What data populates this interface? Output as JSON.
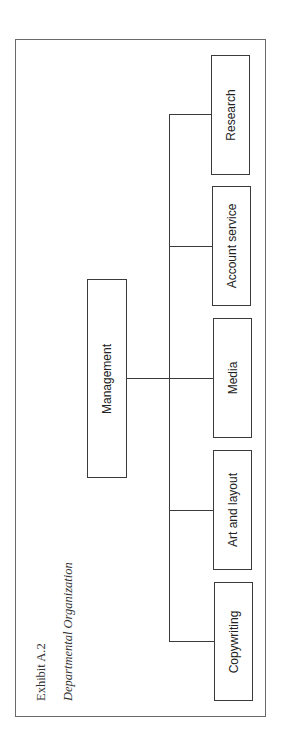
{
  "exhibit": {
    "label": "Exhibit A.2",
    "title": "Departmental Organization"
  },
  "org_chart": {
    "root": {
      "label": "Management"
    },
    "departments": [
      {
        "label": "Copywriting"
      },
      {
        "label": "Art and layout"
      },
      {
        "label": "Media"
      },
      {
        "label": "Account service"
      },
      {
        "label": "Research"
      }
    ]
  },
  "colors": {
    "line": "#3a3a3a",
    "frame": "#6a6a6a",
    "text": "#222222",
    "background": "#ffffff"
  }
}
